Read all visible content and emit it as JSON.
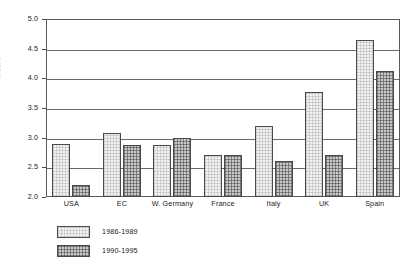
{
  "chart_data": {
    "type": "bar",
    "title": "",
    "subtitle": "",
    "xlabel": "",
    "ylabel": "Percent",
    "categories": [
      "USA",
      "EC",
      "W. Germany",
      "France",
      "Italy",
      "UK",
      "Spain"
    ],
    "series": [
      {
        "name": "1986-1989",
        "values": [
          2.9,
          3.08,
          2.88,
          2.7,
          3.2,
          3.77,
          4.65
        ],
        "color": "#f2f2f2"
      },
      {
        "name": "1990-1995",
        "values": [
          2.2,
          2.88,
          3.0,
          2.7,
          2.6,
          2.7,
          4.13
        ],
        "color": "#c9c9c9"
      }
    ],
    "ylim": [
      2.0,
      5.0
    ],
    "ytick_labels": [
      "5.0",
      "4.5",
      "4.0",
      "3.5",
      "3.0",
      "2.5",
      "2.0"
    ],
    "ytick_values": [
      5.0,
      4.5,
      4.0,
      3.5,
      3.0,
      2.5,
      2.0
    ],
    "grid": true,
    "gridlines_at": [
      4.5,
      4.0,
      3.5,
      3.0,
      2.5
    ],
    "legend_position": "below-left",
    "legend": [
      "1986-1989",
      "1990-1995"
    ]
  }
}
